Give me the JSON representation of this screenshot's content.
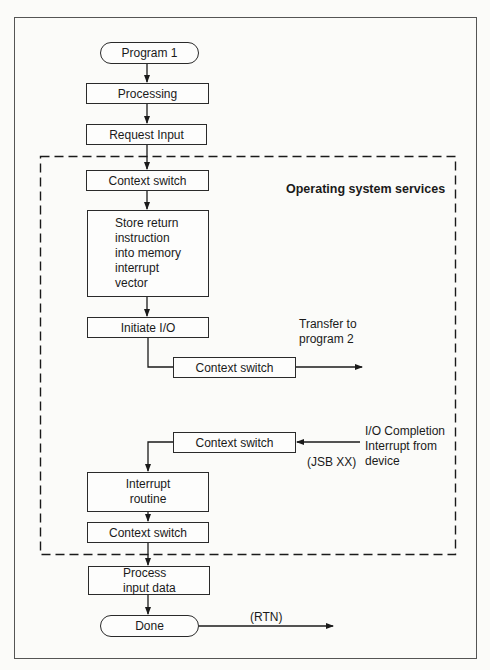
{
  "diagram": {
    "type": "flowchart",
    "region_label": "Operating system services",
    "nodes": {
      "program1": "Program 1",
      "processing": "Processing",
      "request_input": "Request Input",
      "context_switch_1": "Context switch",
      "store_return": "Store return\ninstruction\ninto memory\ninterrupt\nvector",
      "initiate_io": "Initiate I/O",
      "context_switch_2": "Context switch",
      "context_switch_3": "Context switch",
      "interrupt_routine": "Interrupt\nroutine",
      "context_switch_4": "Context switch",
      "process_input": "Process\ninput data",
      "done": "Done"
    },
    "annotations": {
      "transfer": "Transfer to\nprogram 2",
      "io_completion": "I/O Completion\nInterrupt from\ndevice",
      "jsb": "(JSB XX)",
      "rtn": "(RTN)"
    },
    "edges": [
      [
        "program1",
        "processing"
      ],
      [
        "processing",
        "request_input"
      ],
      [
        "request_input",
        "context_switch_1"
      ],
      [
        "context_switch_1",
        "store_return"
      ],
      [
        "store_return",
        "initiate_io"
      ],
      [
        "initiate_io",
        "context_switch_2"
      ],
      [
        "context_switch_2",
        "transfer"
      ],
      [
        "io_completion",
        "context_switch_3"
      ],
      [
        "context_switch_3",
        "interrupt_routine"
      ],
      [
        "interrupt_routine",
        "context_switch_4"
      ],
      [
        "context_switch_4",
        "process_input"
      ],
      [
        "process_input",
        "done"
      ],
      [
        "done",
        "rtn"
      ]
    ]
  }
}
